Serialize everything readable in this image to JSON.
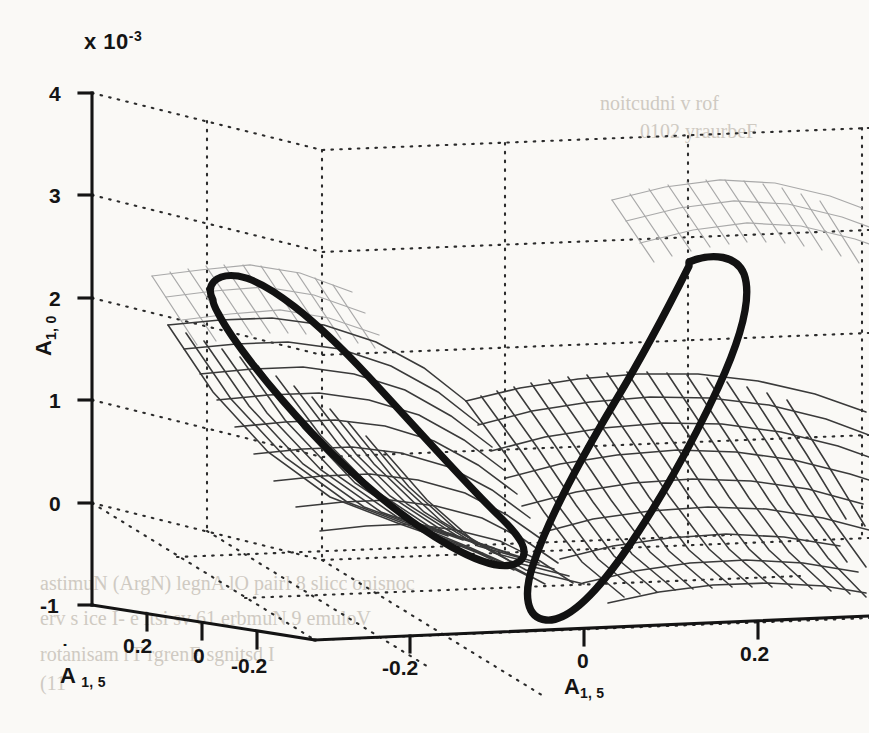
{
  "figure": {
    "type": "3d-surface-plot",
    "background_color": "#faf9f6",
    "ink_color": "#141414",
    "grid_color": "#2b2b2b",
    "mesh_color": "#3a3a3a",
    "mesh_color_far": "#a7a7a7",
    "orbit_color": "#121212"
  },
  "annotations": {
    "z_multiplier": "x 10",
    "z_multiplier_exponent": "-3"
  },
  "axes": {
    "z": {
      "name_base": "A",
      "name_sub": "1, 0",
      "ticks": [
        "4",
        "3",
        "2",
        "1",
        "0",
        "-1"
      ]
    },
    "x_left": {
      "name_base": "A",
      "name_dot": true,
      "name_sub": "1, 5",
      "ticks": [
        "0.2",
        "0",
        "-0.2"
      ]
    },
    "x_right": {
      "name_base": "A",
      "name_dot": false,
      "name_sub": "1, 5",
      "ticks": [
        "-0.2",
        "0",
        "0.2"
      ]
    }
  },
  "bleed_text": [
    {
      "text": "astimuN (ArgN) legnA lO pairl 8 slicc onisnoc",
      "x": 40,
      "y": 572
    },
    {
      "text": "erv s ice I- e itsi sv 61 erbmuN 9 emuloV",
      "x": 40,
      "y": 607
    },
    {
      "text": "rotanisam rT rgrenE sgnitsd I",
      "x": 40,
      "y": 643
    },
    {
      "text": "(11",
      "x": 40,
      "y": 672
    },
    {
      "text": "noitcudni v rof",
      "x": 600,
      "y": 92
    },
    {
      "text": "0102 yraurbeF",
      "x": 640,
      "y": 120
    }
  ],
  "chart_data": {
    "type": "surface",
    "title": "",
    "xlabel": "A_{1,5}",
    "ylabel": "Adot_{1,5}",
    "zlabel": "A_{1,0}",
    "z_scale": 0.001,
    "z_scale_label": "x 10^-3",
    "xlim": [
      -0.32,
      0.32
    ],
    "ylim": [
      -0.32,
      0.32
    ],
    "zlim": [
      -1,
      4
    ],
    "xticks": [
      -0.2,
      0,
      0.2
    ],
    "yticks": [
      -0.2,
      0,
      0.2
    ],
    "zticks": [
      -1,
      0,
      1,
      2,
      3,
      4
    ],
    "grid": true,
    "grid_style": "dotted",
    "legend": null,
    "surface": {
      "u_lines": 22,
      "v_lines": 14,
      "shape": "saddle / hyperbolic paraboloid with raised opposing lobes"
    },
    "orbits": [
      {
        "name": "left-lobe periodic orbit",
        "closed": true,
        "approx_z_peak": 1.9,
        "approx_z_min": -0.35
      },
      {
        "name": "right-lobe periodic orbit",
        "closed": true,
        "approx_z_peak": 2.6,
        "approx_z_min": -0.6
      }
    ]
  }
}
